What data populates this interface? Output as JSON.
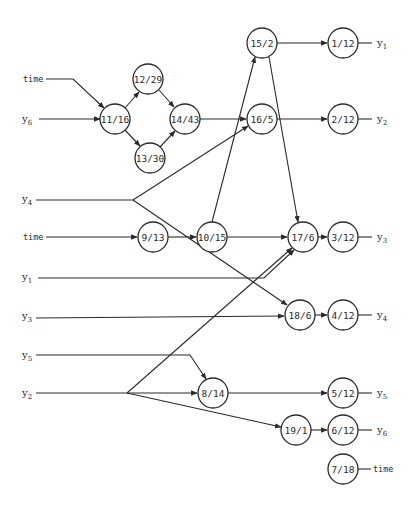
{
  "diagram": {
    "type": "computation-graph",
    "node_radius": 15,
    "colors": {
      "stroke": "#2a2a2a",
      "background": "#ffffff"
    },
    "nodes": [
      {
        "id": "n15_2",
        "label": "15/2",
        "x": 262,
        "y": 43
      },
      {
        "id": "n1_12",
        "label": "1/12",
        "x": 343,
        "y": 43
      },
      {
        "id": "n12_29",
        "label": "12/29",
        "x": 148,
        "y": 79
      },
      {
        "id": "n11_16",
        "label": "11/16",
        "x": 115,
        "y": 119
      },
      {
        "id": "n14_43",
        "label": "14/43",
        "x": 185,
        "y": 119
      },
      {
        "id": "n16_5",
        "label": "16/5",
        "x": 262,
        "y": 119
      },
      {
        "id": "n2_12",
        "label": "2/12",
        "x": 343,
        "y": 119
      },
      {
        "id": "n13_30",
        "label": "13/30",
        "x": 150,
        "y": 158
      },
      {
        "id": "n9_13",
        "label": "9/13",
        "x": 153,
        "y": 237
      },
      {
        "id": "n10_15",
        "label": "10/15",
        "x": 212,
        "y": 237
      },
      {
        "id": "n17_6",
        "label": "17/6",
        "x": 303,
        "y": 237
      },
      {
        "id": "n3_12",
        "label": "3/12",
        "x": 343,
        "y": 237
      },
      {
        "id": "n18_6",
        "label": "18/6",
        "x": 300,
        "y": 315
      },
      {
        "id": "n4_12",
        "label": "4/12",
        "x": 343,
        "y": 315
      },
      {
        "id": "n8_14",
        "label": "8/14",
        "x": 213,
        "y": 393
      },
      {
        "id": "n5_12",
        "label": "5/12",
        "x": 343,
        "y": 393
      },
      {
        "id": "n19_1",
        "label": "19/1",
        "x": 296,
        "y": 430
      },
      {
        "id": "n6_12",
        "label": "6/12",
        "x": 343,
        "y": 430
      },
      {
        "id": "n7_18",
        "label": "7/18",
        "x": 343,
        "y": 469
      }
    ],
    "inputs": [
      {
        "id": "in_time_top",
        "label": "time",
        "kind": "time",
        "x": 23,
        "y": 82
      },
      {
        "id": "in_y6",
        "label": "y",
        "sub": "6",
        "x": 22,
        "y": 122
      },
      {
        "id": "in_y4",
        "label": "y",
        "sub": "4",
        "x": 22,
        "y": 202
      },
      {
        "id": "in_time_mid",
        "label": "time",
        "kind": "time",
        "x": 23,
        "y": 240
      },
      {
        "id": "in_y1",
        "label": "y",
        "sub": "1",
        "x": 22,
        "y": 280
      },
      {
        "id": "in_y3",
        "label": "y",
        "sub": "3",
        "x": 22,
        "y": 319
      },
      {
        "id": "in_y5",
        "label": "y",
        "sub": "5",
        "x": 22,
        "y": 358
      },
      {
        "id": "in_y2",
        "label": "y",
        "sub": "2",
        "x": 22,
        "y": 396
      }
    ],
    "outputs": [
      {
        "id": "out_y1",
        "label": "y",
        "sub": "1",
        "x": 377,
        "y": 46
      },
      {
        "id": "out_y2",
        "label": "y",
        "sub": "2",
        "x": 377,
        "y": 122
      },
      {
        "id": "out_y3",
        "label": "y",
        "sub": "3",
        "x": 377,
        "y": 240
      },
      {
        "id": "out_y4",
        "label": "y",
        "sub": "4",
        "x": 377,
        "y": 318
      },
      {
        "id": "out_y5",
        "label": "y",
        "sub": "5",
        "x": 377,
        "y": 396
      },
      {
        "id": "out_y6",
        "label": "y",
        "sub": "6",
        "x": 377,
        "y": 433
      },
      {
        "id": "out_time",
        "label": "time",
        "kind": "time",
        "x": 373,
        "y": 472
      }
    ]
  }
}
